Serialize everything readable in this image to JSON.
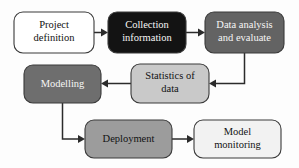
{
  "diagram": {
    "type": "flowchart",
    "background_color": "#fdfdfd",
    "edge_color": "#2b2b2b",
    "nodes": [
      {
        "id": "project-definition",
        "line1": "Project",
        "line2": "definition",
        "fill": "#ffffff",
        "text_color": "#111111",
        "x": 14,
        "y": 12,
        "w": 80,
        "h": 41
      },
      {
        "id": "collection-information",
        "line1": "Collection",
        "line2": "information",
        "fill": "#131313",
        "text_color": "#f6f6f6",
        "x": 108,
        "y": 12,
        "w": 78,
        "h": 41
      },
      {
        "id": "data-analysis-and-evaluate",
        "line1": "Data analysis",
        "line2": "and evaluate",
        "fill": "#636363",
        "text_color": "#f6f6f6",
        "x": 205,
        "y": 12,
        "w": 79,
        "h": 41
      },
      {
        "id": "modelling",
        "line1": "Modelling",
        "line2": "",
        "fill": "#6e6e6e",
        "text_color": "#f6f6f6",
        "x": 24,
        "y": 65,
        "w": 77,
        "h": 38
      },
      {
        "id": "statistics-of-data",
        "line1": "Statistics of",
        "line2": "data",
        "fill": "#c9c9c9",
        "text_color": "#121212",
        "x": 131,
        "y": 64,
        "w": 78,
        "h": 39
      },
      {
        "id": "deployment",
        "line1": "Deployment",
        "line2": "",
        "fill": "#9c9c9c",
        "text_color": "#121212",
        "x": 85,
        "y": 120,
        "w": 87,
        "h": 38
      },
      {
        "id": "model-monitoring",
        "line1": "Model",
        "line2": "monitoring",
        "fill": "#f2f2f2",
        "text_color": "#121212",
        "x": 194,
        "y": 120,
        "w": 87,
        "h": 38
      }
    ],
    "edges": [
      {
        "id": "edge-project-to-collection",
        "from": "project-definition",
        "to": "collection-information"
      },
      {
        "id": "edge-collection-to-analysis",
        "from": "collection-information",
        "to": "data-analysis-and-evaluate"
      },
      {
        "id": "edge-analysis-to-statistics",
        "from": "data-analysis-and-evaluate",
        "to": "statistics-of-data"
      },
      {
        "id": "edge-statistics-to-modelling",
        "from": "statistics-of-data",
        "to": "modelling"
      },
      {
        "id": "edge-modelling-to-deployment",
        "from": "modelling",
        "to": "deployment"
      },
      {
        "id": "edge-deployment-to-monitoring",
        "from": "deployment",
        "to": "model-monitoring"
      }
    ]
  }
}
